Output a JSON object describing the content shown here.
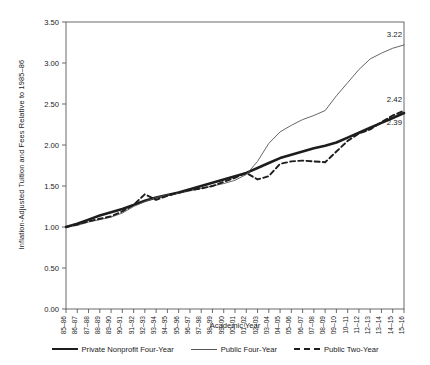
{
  "chart_data": {
    "type": "line",
    "title": "",
    "xlabel": "Academic Year",
    "ylabel": "Inflation-Adjusted Tuition and Fees Relative to 1985–86",
    "ylim": [
      0.0,
      3.5
    ],
    "ytick_step": 0.5,
    "grid": false,
    "legend_position": "bottom",
    "ytick_labels": [
      "0.00",
      "0.50",
      "1.00",
      "1.50",
      "2.00",
      "2.50",
      "3.00",
      "3.50"
    ],
    "categories": [
      "85–86",
      "86–87",
      "87–88",
      "88–89",
      "89–90",
      "90–91",
      "91–92",
      "92–93",
      "93–94",
      "94–95",
      "95–96",
      "96–97",
      "97–98",
      "98–99",
      "99–00",
      "00–01",
      "01–02",
      "02–03",
      "03–04",
      "04–05",
      "05–06",
      "06–07",
      "07–08",
      "08–09",
      "09–10",
      "10–11",
      "11–12",
      "12–13",
      "13–14",
      "14–15",
      "15–16"
    ],
    "series": [
      {
        "name": "Private Nonprofit Four-Year",
        "style": "solid-thick",
        "color": "#1d1d1d",
        "end_label": "2.39",
        "values": [
          1.0,
          1.04,
          1.09,
          1.14,
          1.18,
          1.22,
          1.27,
          1.32,
          1.36,
          1.39,
          1.42,
          1.46,
          1.5,
          1.54,
          1.58,
          1.62,
          1.66,
          1.72,
          1.78,
          1.84,
          1.88,
          1.92,
          1.96,
          1.99,
          2.03,
          2.09,
          2.15,
          2.21,
          2.27,
          2.33,
          2.39
        ]
      },
      {
        "name": "Public Four-Year",
        "style": "solid-thin",
        "color": "#555555",
        "end_label": "3.22",
        "values": [
          1.0,
          1.02,
          1.06,
          1.09,
          1.12,
          1.17,
          1.25,
          1.31,
          1.36,
          1.39,
          1.41,
          1.44,
          1.47,
          1.5,
          1.53,
          1.57,
          1.64,
          1.8,
          2.02,
          2.16,
          2.24,
          2.31,
          2.36,
          2.42,
          2.6,
          2.76,
          2.92,
          3.05,
          3.12,
          3.18,
          3.22
        ]
      },
      {
        "name": "Public Two-Year",
        "style": "dashed",
        "color": "#1d1d1d",
        "end_label": "2.42",
        "values": [
          1.0,
          1.03,
          1.07,
          1.1,
          1.13,
          1.19,
          1.27,
          1.4,
          1.33,
          1.38,
          1.42,
          1.45,
          1.47,
          1.5,
          1.55,
          1.6,
          1.66,
          1.58,
          1.62,
          1.77,
          1.8,
          1.81,
          1.8,
          1.79,
          1.92,
          2.05,
          2.14,
          2.19,
          2.28,
          2.36,
          2.42
        ]
      }
    ]
  },
  "legend": {
    "items": [
      {
        "label": "Private Nonprofit Four-Year"
      },
      {
        "label": "Public Four-Year"
      },
      {
        "label": "Public Two-Year"
      }
    ]
  }
}
